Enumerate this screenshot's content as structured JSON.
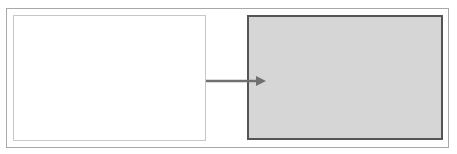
{
  "diagram": {
    "type": "before-after transition",
    "source_box": {
      "fill": "#ffffff",
      "border": "#c8c8c8"
    },
    "target_box": {
      "fill": "#d6d6d6",
      "border": "#555555"
    },
    "arrow": {
      "color": "#707070",
      "direction": "right"
    },
    "frame": {
      "border": "#a8a8a8"
    }
  }
}
